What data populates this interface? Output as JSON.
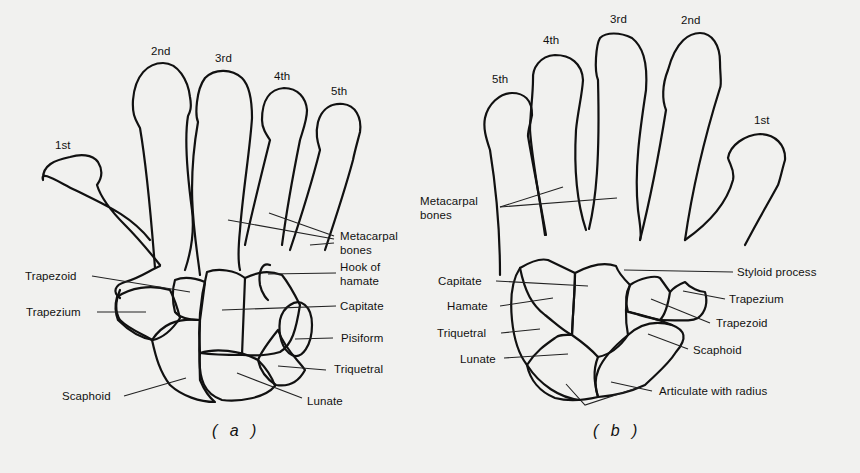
{
  "figure_a": {
    "caption": "( a )",
    "digits": {
      "first": "1st",
      "second": "2nd",
      "third": "3rd",
      "fourth": "4th",
      "fifth": "5th"
    },
    "labels": {
      "metacarpal_bones_line1": "Metacarpal",
      "metacarpal_bones_line2": "bones",
      "hook_of_hamate_line1": "Hook of",
      "hook_of_hamate_line2": "hamate",
      "capitate": "Capitate",
      "pisiform": "Pisiform",
      "triquetral": "Triquetral",
      "lunate": "Lunate",
      "scaphoid": "Scaphoid",
      "trapezoid": "Trapezoid",
      "trapezium": "Trapezium"
    }
  },
  "figure_b": {
    "caption": "( b )",
    "digits": {
      "fifth": "5th",
      "fourth": "4th",
      "third": "3rd",
      "second": "2nd",
      "first": "1st"
    },
    "labels": {
      "metacarpal_bones_line1": "Metacarpal",
      "metacarpal_bones_line2": "bones",
      "capitate": "Capitate",
      "hamate": "Hamate",
      "triquetral": "Triquetral",
      "lunate": "Lunate",
      "styloid_process": "Styloid process",
      "trapezium": "Trapezium",
      "trapezoid": "Trapezoid",
      "scaphoid": "Scaphoid",
      "articulate_with_radius": "Articulate with radius"
    }
  },
  "colors": {
    "background": "#f1f1ef",
    "ink": "#111111"
  }
}
